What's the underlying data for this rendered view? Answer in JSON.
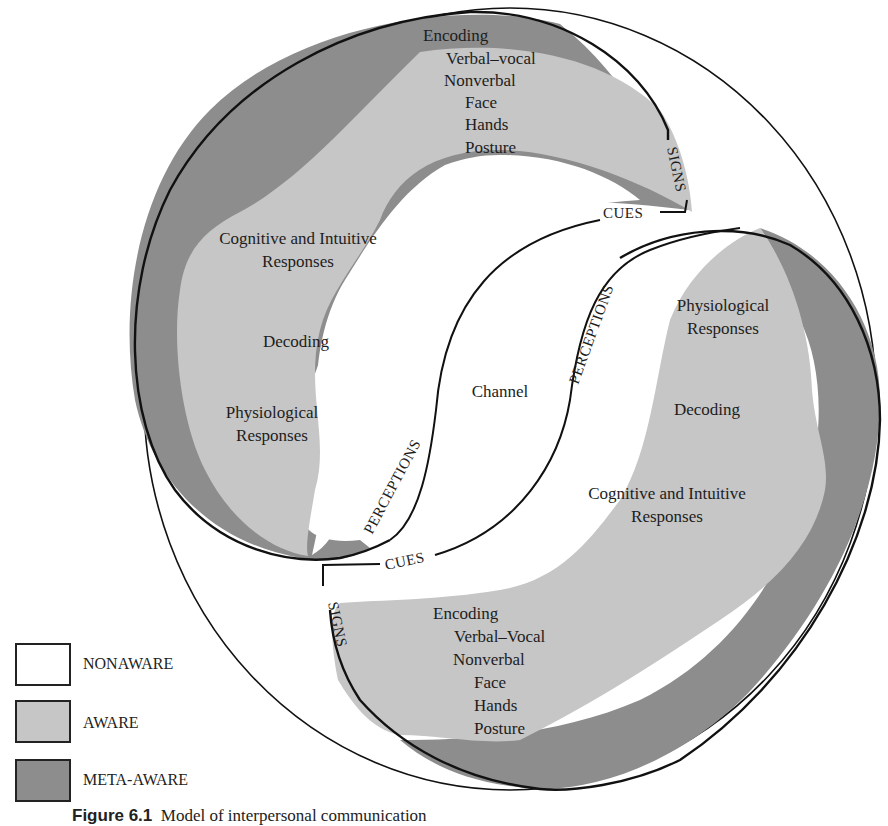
{
  "figure": {
    "colors": {
      "nonaware": "#ffffff",
      "aware": "#c6c6c6",
      "meta_aware": "#8d8d8d",
      "outline": "#111111"
    },
    "top_left_person": {
      "encoding": {
        "title": "Encoding",
        "lines": [
          "Verbal–vocal",
          "Nonverbal",
          "Face",
          "Hands",
          "Posture"
        ]
      },
      "cognitive": [
        "Cognitive and Intuitive",
        "Responses"
      ],
      "decoding": "Decoding",
      "physiological": [
        "Physiological",
        "Responses"
      ]
    },
    "bottom_right_person": {
      "physiological": [
        "Physiological",
        "Responses"
      ],
      "decoding": "Decoding",
      "cognitive": [
        "Cognitive and Intuitive",
        "Responses"
      ],
      "encoding": {
        "title": "Encoding",
        "lines": [
          "Verbal–Vocal",
          "Nonverbal",
          "Face",
          "Hands",
          "Posture"
        ]
      }
    },
    "center_label": "Channel",
    "path_labels": {
      "signs_top": "SIGNS",
      "cues_top": "CUES",
      "perceptions_left": "PERCEPTIONS",
      "perceptions_right": "PERCEPTIONS",
      "cues_bottom": "CUES",
      "signs_bottom": "SIGNS"
    }
  },
  "legend": [
    {
      "label": "NONAWARE",
      "color": "#ffffff"
    },
    {
      "label": "AWARE",
      "color": "#c6c6c6"
    },
    {
      "label": "META-AWARE",
      "color": "#8d8d8d"
    }
  ],
  "caption": {
    "number": "Figure 6.1",
    "text": "Model of interpersonal communication"
  }
}
